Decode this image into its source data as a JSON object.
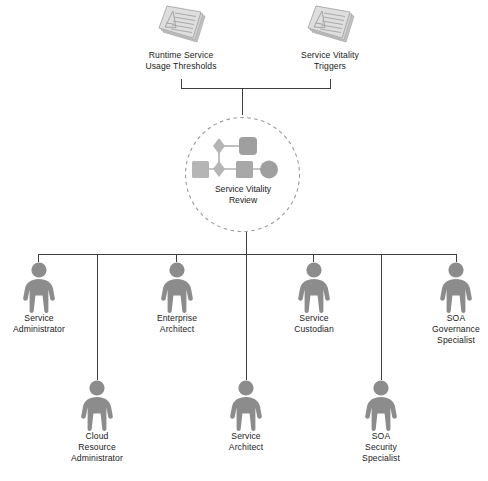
{
  "diagram": {
    "title": "Service Vitality Review",
    "colors": {
      "line": "#3d3d3d",
      "person": "#8c8c8c",
      "person_dark": "#7a7a7a",
      "document": "#cfcfcf",
      "document_edge": "#a8a8a8",
      "shape": "#b8b8b8",
      "shape_dark": "#a0a0a0",
      "dashed_circle": "#9a9a9a",
      "text": "#1a1a1a"
    },
    "inputs": [
      {
        "id": "runtime-service-usage-thresholds",
        "label": "Runtime Service\nUsage Thresholds",
        "icon": "document-stack-icon"
      },
      {
        "id": "service-vitality-triggers",
        "label": "Service Vitality\nTriggers",
        "icon": "document-stack-icon"
      }
    ],
    "process": {
      "id": "service-vitality-review",
      "label": "Service Vitality\nReview",
      "icon": "process-shapes-icon",
      "container": "dashed-circle"
    },
    "roles_top": [
      {
        "id": "service-administrator",
        "label": "Service\nAdministrator",
        "icon": "person-icon"
      },
      {
        "id": "enterprise-architect",
        "label": "Enterprise\nArchitect",
        "icon": "person-icon"
      },
      {
        "id": "service-custodian",
        "label": "Service\nCustodian",
        "icon": "person-icon"
      },
      {
        "id": "soa-governance-specialist",
        "label": "SOA\nGovernance\nSpecialist",
        "icon": "person-icon"
      }
    ],
    "roles_bottom": [
      {
        "id": "cloud-resource-administrator",
        "label": "Cloud\nResource\nAdministrator",
        "icon": "person-icon"
      },
      {
        "id": "service-architect",
        "label": "Service\nArchitect",
        "icon": "person-icon"
      },
      {
        "id": "soa-security-specialist",
        "label": "SOA\nSecurity\nSpecialist",
        "icon": "person-icon"
      }
    ]
  }
}
